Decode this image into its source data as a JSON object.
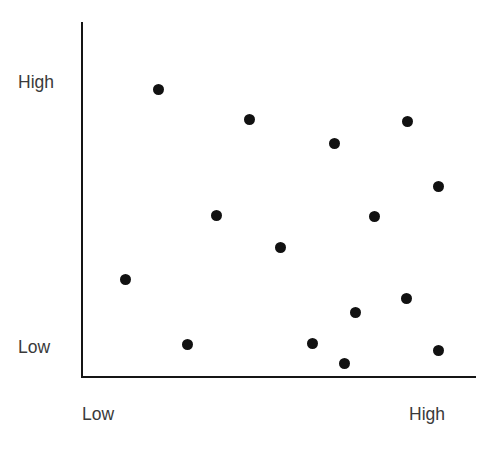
{
  "chart_data": {
    "type": "scatter",
    "title": "",
    "subtitle": "",
    "xlabel": "",
    "ylabel": "",
    "xlim": [
      0,
      1
    ],
    "ylim": [
      0,
      1
    ],
    "grid": false,
    "legend": null,
    "marker": {
      "shape": "circle",
      "color": "#111111",
      "size_px": 11
    },
    "axis_color": "#151515",
    "label_color": "#3a3a3a",
    "x_tick_labels": [
      "Low",
      "High"
    ],
    "y_tick_labels": [
      "Low",
      "High"
    ],
    "series": [
      {
        "name": "points",
        "points": [
          {
            "px": 158,
            "py": 89,
            "x": 0.195,
            "y": 0.81
          },
          {
            "px": 249,
            "py": 119,
            "x": 0.426,
            "y": 0.725
          },
          {
            "px": 407,
            "py": 121,
            "x": 0.827,
            "y": 0.72
          },
          {
            "px": 334,
            "py": 143,
            "x": 0.642,
            "y": 0.658
          },
          {
            "px": 438,
            "py": 186,
            "x": 0.906,
            "y": 0.537
          },
          {
            "px": 216,
            "py": 215,
            "x": 0.342,
            "y": 0.455
          },
          {
            "px": 374,
            "py": 216,
            "x": 0.743,
            "y": 0.452
          },
          {
            "px": 280,
            "py": 247,
            "x": 0.505,
            "y": 0.365
          },
          {
            "px": 125,
            "py": 279,
            "x": 0.112,
            "y": 0.275
          },
          {
            "px": 406,
            "py": 298,
            "x": 0.824,
            "y": 0.22
          },
          {
            "px": 355,
            "py": 312,
            "x": 0.695,
            "y": 0.182
          },
          {
            "px": 187,
            "py": 344,
            "x": 0.269,
            "y": 0.092
          },
          {
            "px": 312,
            "py": 343,
            "x": 0.586,
            "y": 0.094
          },
          {
            "px": 438,
            "py": 350,
            "x": 0.906,
            "y": 0.074
          },
          {
            "px": 344,
            "py": 363,
            "x": 0.667,
            "y": 0.037
          }
        ]
      }
    ]
  },
  "axes": {
    "y": {
      "high_label": "High",
      "low_label": "Low"
    },
    "x": {
      "low_label": "Low",
      "high_label": "High"
    }
  }
}
